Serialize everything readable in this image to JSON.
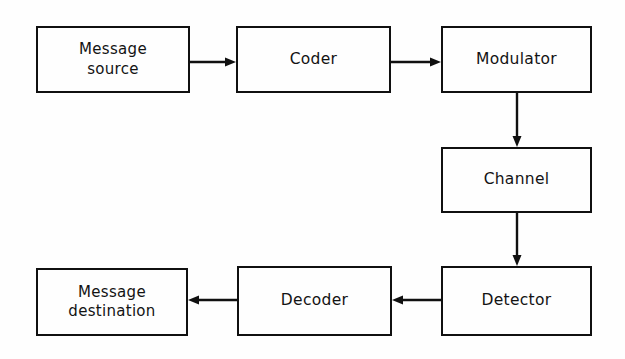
{
  "figure": {
    "type": "block-diagram",
    "background_color": "#fefefe",
    "stroke_color": "#101010",
    "text_color": "#131313",
    "width": 625,
    "height": 359
  },
  "nodes": [
    {
      "id": "message-source",
      "label": "Message\nsource",
      "label_lines": [
        "Message",
        "source"
      ],
      "x": 36,
      "y": 26,
      "w": 154,
      "h": 67
    },
    {
      "id": "coder",
      "label": "Coder",
      "label_lines": [
        "Coder"
      ],
      "x": 236,
      "y": 26,
      "w": 155,
      "h": 67
    },
    {
      "id": "modulator",
      "label": "Modulator",
      "label_lines": [
        "Modulator"
      ],
      "x": 441,
      "y": 26,
      "w": 151,
      "h": 67
    },
    {
      "id": "channel",
      "label": "Channel",
      "label_lines": [
        "Channel"
      ],
      "x": 441,
      "y": 147,
      "w": 151,
      "h": 66
    },
    {
      "id": "detector",
      "label": "Detector",
      "label_lines": [
        "Detector"
      ],
      "x": 441,
      "y": 266,
      "w": 151,
      "h": 70
    },
    {
      "id": "decoder",
      "label": "Decoder",
      "label_lines": [
        "Decoder"
      ],
      "x": 237,
      "y": 266,
      "w": 155,
      "h": 70
    },
    {
      "id": "message-destination",
      "label": "Message\ndestination",
      "label_lines": [
        "Message",
        "destination"
      ],
      "x": 36,
      "y": 268,
      "w": 152,
      "h": 68
    }
  ],
  "connections": [
    {
      "id": "source-to-coder",
      "from": "message-source",
      "to": "coder",
      "direction": "right",
      "x1": 190,
      "y1": 62,
      "x2": 236,
      "y2": 62
    },
    {
      "id": "coder-to-modulator",
      "from": "coder",
      "to": "modulator",
      "direction": "right",
      "x1": 391,
      "y1": 62,
      "x2": 441,
      "y2": 62
    },
    {
      "id": "modulator-to-channel",
      "from": "modulator",
      "to": "channel",
      "direction": "down",
      "x1": 517,
      "y1": 93,
      "x2": 517,
      "y2": 147
    },
    {
      "id": "channel-to-detector",
      "from": "channel",
      "to": "detector",
      "direction": "down",
      "x1": 517,
      "y1": 213,
      "x2": 517,
      "y2": 266
    },
    {
      "id": "detector-to-decoder",
      "from": "detector",
      "to": "decoder",
      "direction": "left",
      "x1": 441,
      "y1": 300,
      "x2": 392,
      "y2": 300
    },
    {
      "id": "decoder-to-destination",
      "from": "decoder",
      "to": "message-destination",
      "direction": "left",
      "x1": 237,
      "y1": 300,
      "x2": 188,
      "y2": 300
    }
  ]
}
